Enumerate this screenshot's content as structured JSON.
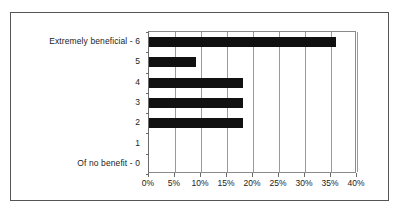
{
  "chart_data": {
    "type": "bar",
    "orientation": "horizontal",
    "title": "",
    "subtitle": "",
    "xlabel": "",
    "ylabel": "",
    "categories": [
      "Extremely beneficial - 6",
      "5",
      "4",
      "3",
      "2",
      "1",
      "Of no benefit - 0"
    ],
    "values": [
      36,
      9,
      18,
      18,
      18,
      0,
      0
    ],
    "value_suffix": "%",
    "xlim": [
      0,
      40
    ],
    "xtick_values": [
      0,
      5,
      10,
      15,
      20,
      25,
      30,
      35,
      40
    ],
    "xtick_labels": [
      "0%",
      "5%",
      "10%",
      "15%",
      "20%",
      "25%",
      "30%",
      "35%",
      "40%"
    ],
    "grid": "vertical",
    "legend": "none",
    "bar_color": "#111111",
    "axis_color": "#8a8a8a",
    "grid_color": "#9a9a9a",
    "background_color": "#ffffff"
  }
}
